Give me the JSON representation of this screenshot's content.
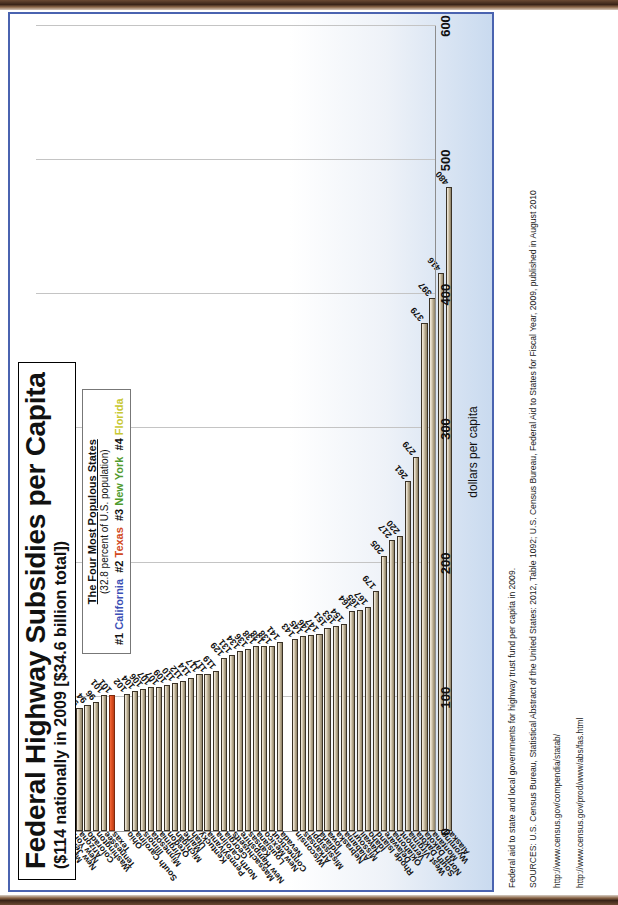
{
  "title": "Federal Highway Subsidies per Capita",
  "subtitle": "($114 nationally in 2009 [$34.6 billion total])",
  "legend": {
    "title": "The Four Most Populous States",
    "subtitle": "(32.8 percent of U.S. population)",
    "rank1": "#1",
    "state1": "California",
    "rank2": "#2",
    "state2": "Texas",
    "rank3": "#3",
    "state3": "New York",
    "rank4": "#4",
    "state4": "Florida"
  },
  "caption": {
    "note": "Federal aid to state and local governments for highway trust fund per capita in 2009.",
    "sources": "SOURCES: U.S. Census Bureau, Statistical Abstract of the United States: 2012, Table 1092; U.S. Census Bureau, Federal Aid to States for Fiscal Year, 2009, published in August 2010",
    "url1": "http://www.census.gov/compendia/statab/",
    "url2": "http://www.census.gov/prod/www/abs/fas.html"
  },
  "colors": {
    "california": "#3b4fb5",
    "texas": "#df4f20",
    "new_york": "#56a32c",
    "florida": "#dada2f",
    "other": "#c9bda3",
    "border": "#4a63b0"
  },
  "chart_data": {
    "type": "bar",
    "orientation": "horizontal",
    "title": "Federal Highway Subsidies per Capita",
    "subtitle": "($114 nationally in 2009 [$34.6 billion total])",
    "xlabel": "dollars per capita",
    "ylabel": "",
    "xlim": [
      0,
      600
    ],
    "xticks": [
      0,
      100,
      200,
      300,
      400,
      500,
      600
    ],
    "grid": true,
    "legend_position": "top-center",
    "categories": [
      "California",
      "Florida",
      "Maryland",
      "New Jersey",
      "New York",
      "Arizona",
      "Colorado",
      "Washington",
      "Tennessee",
      "Texas",
      "Ohio",
      "South Carolina",
      "Illinois",
      "Minnesota",
      "Virginia",
      "Oregon",
      "Michigan",
      "Maine",
      "Utah",
      "Kentucky",
      "Pennsylvania",
      "North Carolina",
      "Georgia",
      "Massachusetts",
      "New Hampshire",
      "Kansas",
      "Louisiana",
      "New Mexico",
      "Connecticut",
      "Nevada",
      "Wisconsin",
      "Arkansas",
      "Mississippi",
      "Indiana",
      "Iowa",
      "Nebraska",
      "Alabama",
      "Missouri",
      "Hawaii",
      "Idaho",
      "Rhode Island",
      "Delaware",
      "Oklahoma",
      "Vermont",
      "West Virginia",
      "South Dakota",
      "North Dakota",
      "Montana",
      "Wyoming",
      "Alaska"
    ],
    "values": [
      67,
      82,
      87,
      91,
      91,
      92,
      94,
      96,
      101,
      101,
      102,
      104,
      106,
      107,
      107,
      109,
      110,
      112,
      114,
      117,
      117,
      119,
      129,
      131,
      134,
      136,
      138,
      138,
      138,
      141,
      143,
      145,
      146,
      147,
      151,
      153,
      154,
      164,
      165,
      167,
      179,
      205,
      217,
      220,
      261,
      279,
      379,
      397,
      416,
      480
    ],
    "highlight": {
      "California": "#3b4fb5",
      "Texas": "#df4f20",
      "New York": "#56a32c",
      "Florida": "#dada2f"
    },
    "national_average": 114,
    "national_total_billions": 34.6
  }
}
